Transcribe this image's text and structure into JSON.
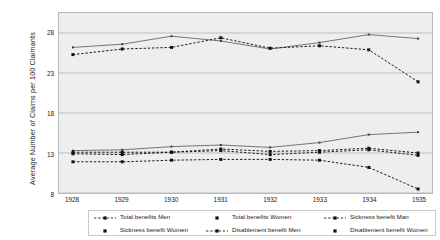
{
  "chart_data": {
    "type": "line",
    "title": "",
    "xlabel": "",
    "ylabel": "Average Number of Claims per 100 Claimants",
    "categories": [
      "1928",
      "1929",
      "1930",
      "1931",
      "1932",
      "1933",
      "1934",
      "1935"
    ],
    "x": [
      1928,
      1929,
      1930,
      1931,
      1932,
      1933,
      1934,
      1935
    ],
    "ylim": [
      8,
      30.5
    ],
    "yticks": [
      8,
      13,
      18,
      23,
      28
    ],
    "grid": true,
    "legend_position": "bottom",
    "series": [
      {
        "name": "Total benefits Men",
        "values": [
          26.2,
          26.6,
          27.6,
          27.0,
          26.0,
          26.8,
          27.8,
          27.3
        ],
        "marker": "small-square",
        "line": "solid",
        "color": "#555555"
      },
      {
        "name": "Total benefits Women",
        "values": [
          25.3,
          26.0,
          26.2,
          27.4,
          26.1,
          26.4,
          25.9,
          21.9
        ],
        "marker": "square",
        "line": "dashed",
        "color": "#1a1a1a"
      },
      {
        "name": "Sickness benefit Men",
        "values": [
          13.3,
          13.4,
          13.8,
          14.0,
          13.7,
          14.3,
          15.3,
          15.6
        ],
        "marker": "small-square",
        "line": "solid",
        "color": "#555555"
      },
      {
        "name": "Sickness benefit Women",
        "values": [
          13.1,
          13.1,
          13.1,
          13.5,
          13.2,
          13.3,
          13.6,
          13.0
        ],
        "marker": "square",
        "line": "dashed",
        "color": "#1a1a1a"
      },
      {
        "name": "Disablement benefit Men",
        "values": [
          12.9,
          12.8,
          13.1,
          13.3,
          12.8,
          13.1,
          13.4,
          12.7
        ],
        "marker": "square",
        "line": "dashed",
        "color": "#1a1a1a"
      },
      {
        "name": "Disablement benefit Women",
        "values": [
          11.9,
          11.9,
          12.1,
          12.2,
          12.2,
          12.1,
          11.2,
          8.5
        ],
        "marker": "square",
        "line": "dashed",
        "color": "#1a1a1a"
      }
    ]
  },
  "legend": {
    "entries": [
      {
        "label": "Total benefits Men",
        "style": "dashed-square"
      },
      {
        "label": "Total benefits Women",
        "style": "marker-only"
      },
      {
        "label": "Sickness benefit Man",
        "style": "dashed-square"
      },
      {
        "label": "Sickness benefit Women",
        "style": "marker-only"
      },
      {
        "label": "Disablement benefit Men",
        "style": "dashed-square"
      },
      {
        "label": "Disablement benefit Women",
        "style": "marker-only"
      }
    ]
  },
  "colors": {
    "plot_background": "#eeeeee",
    "grid": "#a8a8a8",
    "frame": "#b9b9b9",
    "series_dark": "#1a1a1a",
    "series_light": "#555555",
    "text": "#1a1a1a"
  }
}
